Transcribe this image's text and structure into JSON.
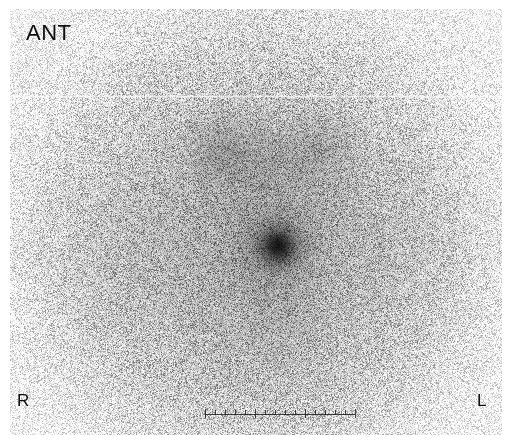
{
  "image": {
    "modality": "planar-scintigraphy",
    "colormap": "inverted-grayscale",
    "width": 508,
    "height": 443,
    "field": {
      "left": 10,
      "top": 9,
      "width": 492,
      "height": 426
    },
    "background_color": "#ffffff",
    "ink_color": "#101010"
  },
  "annotations": {
    "orientation_label": "ANT",
    "right_label": "R",
    "left_label": "L"
  },
  "scalebar": {
    "left": 205,
    "top": 409,
    "width": 150,
    "tick_count": 16,
    "major_every": 5
  },
  "artifacts": {
    "scanline": {
      "left": 0,
      "top": 86,
      "width": 492,
      "opacity": 0.8
    }
  },
  "chart_data": {
    "type": "heatmap",
    "xlabel": "",
    "ylabel": "",
    "colormap": "inverted-grayscale",
    "note": "Dark pixels denote high radiotracer counts.",
    "regions": [
      {
        "name": "thyroid-left-lobe",
        "cx": 222,
        "cy": 150,
        "rx": 42,
        "ry": 34,
        "intensity": 0.3,
        "blur": 17
      },
      {
        "name": "thyroid-isthmus",
        "cx": 272,
        "cy": 160,
        "rx": 30,
        "ry": 20,
        "intensity": 0.2,
        "blur": 16
      },
      {
        "name": "thyroid-right-lobe",
        "cx": 322,
        "cy": 148,
        "rx": 36,
        "ry": 32,
        "intensity": 0.26,
        "blur": 17
      },
      {
        "name": "diffuse-neck-halo",
        "cx": 272,
        "cy": 168,
        "rx": 104,
        "ry": 60,
        "intensity": 0.13,
        "blur": 30
      },
      {
        "name": "focal-hotspot-halo",
        "cx": 278,
        "cy": 246,
        "rx": 46,
        "ry": 44,
        "intensity": 0.34,
        "blur": 20
      },
      {
        "name": "focal-hotspot-core",
        "cx": 278,
        "cy": 246,
        "rx": 27,
        "ry": 26,
        "intensity": 0.88,
        "blur": 9
      },
      {
        "name": "focal-hotspot-peak",
        "cx": 278,
        "cy": 246,
        "rx": 15,
        "ry": 15,
        "intensity": 0.97,
        "blur": 5
      },
      {
        "name": "inferior-tail",
        "cx": 282,
        "cy": 310,
        "rx": 18,
        "ry": 44,
        "intensity": 0.16,
        "blur": 22
      },
      {
        "name": "mediastinal-blush",
        "cx": 268,
        "cy": 350,
        "rx": 70,
        "ry": 48,
        "intensity": 0.09,
        "blur": 34
      },
      {
        "name": "soft-tissue-left",
        "cx": 120,
        "cy": 250,
        "rx": 80,
        "ry": 110,
        "intensity": 0.07,
        "blur": 38
      },
      {
        "name": "soft-tissue-right",
        "cx": 400,
        "cy": 250,
        "rx": 80,
        "ry": 110,
        "intensity": 0.08,
        "blur": 38
      }
    ]
  }
}
